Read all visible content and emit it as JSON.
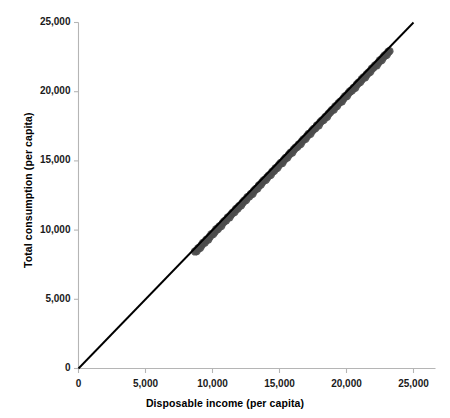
{
  "chart_data": {
    "type": "scatter",
    "title": "",
    "xlabel": "Disposable income (per capita)",
    "ylabel": "Total consumption (per capita)",
    "xlim": [
      0,
      25000
    ],
    "ylim": [
      0,
      25000
    ],
    "xticks": [
      "0",
      "5,000",
      "10,000",
      "15,000",
      "20,000",
      "25,000"
    ],
    "yticks": [
      "0",
      "5,000",
      "10,000",
      "15,000",
      "20,000",
      "25,000"
    ],
    "xtick_values": [
      0,
      5000,
      10000,
      15000,
      20000,
      25000
    ],
    "ytick_values": [
      0,
      5000,
      10000,
      15000,
      20000,
      25000
    ],
    "grid": false,
    "legend": "none",
    "marker_color": "#4d4d4d",
    "line_color": "#000000",
    "axis_color": "#b5b5b5",
    "background_color": "#ffffff",
    "reference_line": {
      "name": "45-degree line",
      "x": [
        0,
        25000
      ],
      "y": [
        0,
        25000
      ]
    },
    "x": [
      8700,
      8820,
      8950,
      9080,
      9200,
      9310,
      9430,
      9550,
      9680,
      9800,
      9930,
      10050,
      10170,
      10290,
      10400,
      10520,
      10650,
      10780,
      10900,
      11020,
      11150,
      11270,
      11390,
      11510,
      11640,
      11760,
      11880,
      12000,
      12130,
      12250,
      12370,
      12500,
      12620,
      12750,
      12870,
      12990,
      13110,
      13240,
      13360,
      13480,
      13610,
      13730,
      13850,
      13980,
      14100,
      14220,
      14350,
      14470,
      14600,
      14720,
      14840,
      14970,
      15090,
      15210,
      15340,
      15460,
      15580,
      15710,
      15830,
      15950,
      16080,
      16200,
      16330,
      16450,
      16570,
      16700,
      16820,
      16940,
      17070,
      17190,
      17310,
      17440,
      17560,
      17690,
      17810,
      17930,
      18060,
      18180,
      18300,
      18430,
      18550,
      18670,
      18800,
      18920,
      19050,
      19170,
      19290,
      19420,
      19540,
      19660,
      19790,
      19910,
      20030,
      20160,
      20280,
      20410,
      20530,
      20650,
      20780,
      20900,
      21020,
      21150,
      21270,
      21390,
      21520,
      21640,
      21770,
      21890,
      22010,
      22140,
      22260,
      22380,
      22510,
      22630,
      22760,
      22880,
      23000,
      23120,
      23200
    ],
    "y": [
      8400,
      8530,
      8660,
      8780,
      8900,
      9010,
      9140,
      9260,
      9390,
      9500,
      9640,
      9760,
      9870,
      10000,
      10110,
      10230,
      10360,
      10490,
      10600,
      10730,
      10860,
      10970,
      11100,
      11210,
      11350,
      11460,
      11580,
      11700,
      11840,
      11950,
      12070,
      12200,
      12320,
      12460,
      12570,
      12690,
      12810,
      12950,
      13060,
      13180,
      13320,
      13430,
      13550,
      13690,
      13800,
      13920,
      14060,
      14170,
      14310,
      14420,
      14540,
      14680,
      14790,
      14910,
      15050,
      15160,
      15280,
      15420,
      15530,
      15650,
      15790,
      15900,
      16040,
      16150,
      16270,
      16410,
      16520,
      16640,
      16780,
      16890,
      17010,
      17150,
      17260,
      17400,
      17510,
      17630,
      17770,
      17880,
      18000,
      18140,
      18250,
      18370,
      18510,
      18620,
      18760,
      18870,
      18990,
      19130,
      19240,
      19360,
      19500,
      19610,
      19730,
      19870,
      19980,
      20120,
      20230,
      20350,
      20490,
      20600,
      20720,
      20860,
      20970,
      21090,
      21230,
      21340,
      21480,
      21590,
      21710,
      21850,
      21960,
      22080,
      22220,
      22330,
      22470,
      22580,
      22700,
      22820,
      22900
    ],
    "jitter": [
      60,
      -40,
      35,
      -55,
      20,
      70,
      -30,
      45,
      -65,
      25,
      55,
      -45,
      15,
      65,
      -35,
      40,
      -60,
      30,
      50,
      -25,
      60,
      -50,
      20,
      45,
      -40,
      70,
      -20,
      35,
      -55,
      25,
      50,
      -35,
      65,
      -25,
      45,
      -60,
      30,
      20,
      -45,
      55,
      -30,
      40,
      60,
      -50,
      25,
      35,
      -65,
      45,
      -20,
      50,
      -40,
      30,
      65,
      -55,
      20,
      45,
      -35,
      25,
      60,
      -45,
      35,
      50,
      -25,
      40,
      -60,
      30,
      55,
      -35,
      20,
      65,
      -45,
      25,
      50,
      -30,
      60,
      -55,
      35,
      45,
      -20,
      40,
      -65,
      30,
      25,
      55,
      -40,
      60,
      -30,
      45,
      35,
      -50,
      20,
      65,
      -45,
      30,
      55,
      -25,
      40,
      -60,
      35,
      50,
      -30,
      45,
      60,
      -55,
      25,
      35,
      -40,
      65,
      30,
      50,
      -45,
      20,
      55,
      -35,
      40,
      60,
      -25,
      45,
      30
    ],
    "marker_radius_px": 4.2,
    "n_points": 119
  },
  "axes": {
    "x": {
      "label": "Disposable income (per capita)"
    },
    "y": {
      "label": "Total consumption (per capita)"
    }
  }
}
